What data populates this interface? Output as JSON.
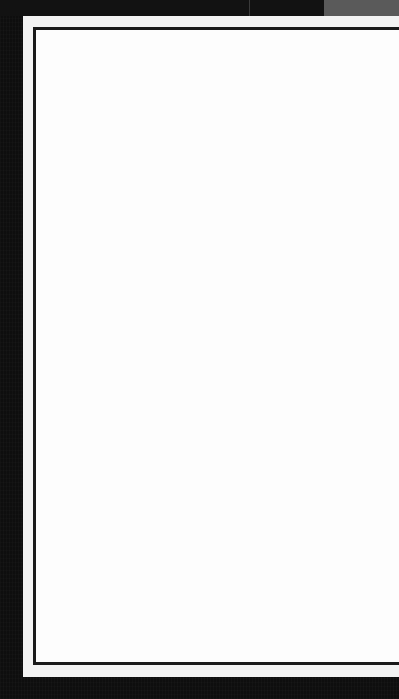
{
  "document": {
    "type": "blank-bordered-page",
    "content_text": ""
  },
  "colors": {
    "background": "#0e0e0e",
    "top_corner_block": "#5a5a5a",
    "paper": "#f3f3f3",
    "page": "#fdfdfd",
    "frame_border": "#1a1a1a"
  }
}
